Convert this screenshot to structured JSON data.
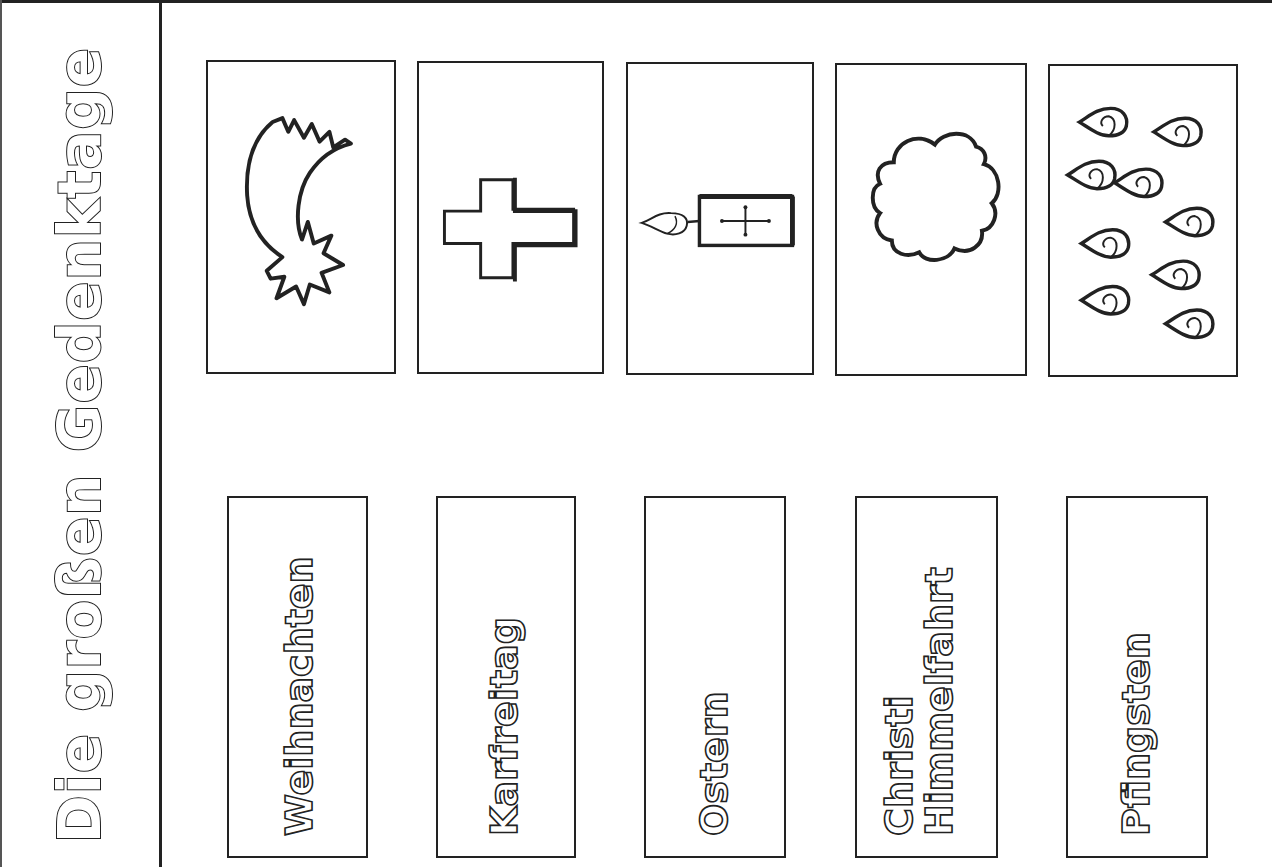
{
  "worksheet": {
    "title": "Die großen Gedenktage",
    "stroke_color": "#222222",
    "background_color": "#ffffff"
  },
  "picture_cards": [
    {
      "id": "weihnachten-picture",
      "icon": "shooting-star-icon",
      "description": "Komet / Stern von Betlehem"
    },
    {
      "id": "karfreitag-picture",
      "icon": "cross-icon",
      "description": "Kreuz"
    },
    {
      "id": "ostern-picture",
      "icon": "easter-candle-icon",
      "description": "Osterkerze mit Kreuz"
    },
    {
      "id": "himmelfahrt-picture",
      "icon": "cloud-icon",
      "description": "Wolke"
    },
    {
      "id": "pfingsten-picture",
      "icon": "flames-icon",
      "description": "Feuerzungen",
      "flame_count": 9
    }
  ],
  "label_cards": [
    {
      "lines": [
        "Weihnachten"
      ]
    },
    {
      "lines": [
        "Karfreitag"
      ]
    },
    {
      "lines": [
        "Ostern"
      ]
    },
    {
      "lines": [
        "Christi",
        "Himmelfahrt"
      ]
    },
    {
      "lines": [
        "Pfingsten"
      ]
    }
  ]
}
